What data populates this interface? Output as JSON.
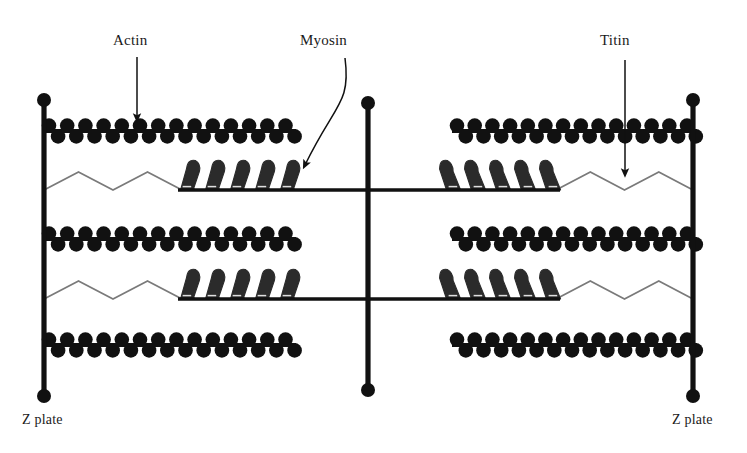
{
  "diagram": {
    "background_color": "#ffffff",
    "ink_color": "#111111",
    "titin_color": "#7a7a7a",
    "myosin_head_color": "#2b2b2b",
    "labels": {
      "actin": "Actin",
      "myosin": "Myosin",
      "titin": "Titin",
      "z_plate_left": "Z plate",
      "z_plate_right": "Z plate"
    },
    "annotations": [
      {
        "name": "actin-annotation",
        "label": "Actin",
        "label_x": 113,
        "label_y": 45,
        "arrow_type": "straight",
        "arrow_from_x": 137,
        "arrow_from_y": 57,
        "arrow_to_x": 137,
        "arrow_to_y": 118
      },
      {
        "name": "myosin-annotation",
        "label": "Myosin",
        "label_x": 300,
        "label_y": 45,
        "arrow_type": "curved",
        "arrow_from_x": 345,
        "arrow_from_y": 58,
        "arrow_to_x": 305,
        "arrow_to_y": 165
      },
      {
        "name": "titin-annotation",
        "label": "Titin",
        "label_x": 600,
        "label_y": 45,
        "arrow_type": "straight",
        "arrow_from_x": 625,
        "arrow_from_y": 60,
        "arrow_to_x": 625,
        "arrow_to_y": 173
      }
    ],
    "z_plates": [
      {
        "name": "z-plate-left",
        "x": 44,
        "y_top": 100,
        "y_bottom": 396,
        "cap_radius": 7,
        "label": "Z plate",
        "label_x": 22,
        "label_y": 424
      },
      {
        "name": "z-plate-right",
        "x": 693,
        "y_top": 100,
        "y_bottom": 396,
        "cap_radius": 7,
        "label": "Z plate",
        "label_x": 672,
        "label_y": 424
      }
    ],
    "m_line": {
      "name": "m-line",
      "x": 368,
      "y_top": 103,
      "y_bottom": 390,
      "cap_radius": 7
    },
    "actin_filaments": [
      {
        "name": "actin-filament-top-left",
        "side": "left",
        "y": 131,
        "x_start": 44,
        "x_end": 296,
        "bead_count": 14
      },
      {
        "name": "actin-filament-top-right",
        "side": "right",
        "y": 131,
        "x_start": 452,
        "x_end": 697,
        "bead_count": 14
      },
      {
        "name": "actin-filament-mid-left",
        "side": "left",
        "y": 239,
        "x_start": 44,
        "x_end": 296,
        "bead_count": 14
      },
      {
        "name": "actin-filament-mid-right",
        "side": "right",
        "y": 239,
        "x_start": 452,
        "x_end": 697,
        "bead_count": 14
      },
      {
        "name": "actin-filament-bottom-left",
        "side": "left",
        "y": 345,
        "x_start": 44,
        "x_end": 296,
        "bead_count": 14
      },
      {
        "name": "actin-filament-bottom-right",
        "side": "right",
        "y": 345,
        "x_start": 452,
        "x_end": 697,
        "bead_count": 14
      }
    ],
    "myosin_filaments": [
      {
        "name": "myosin-filament-upper",
        "y": 190,
        "x_start": 182,
        "x_end": 556,
        "head_count_per_side": 5
      },
      {
        "name": "myosin-filament-lower",
        "y": 299,
        "x_start": 182,
        "x_end": 556,
        "head_count_per_side": 5
      }
    ],
    "titin_strands": [
      {
        "name": "titin-strand-upper-left",
        "side": "left",
        "y_base": 190,
        "x_start": 44,
        "x_end": 182,
        "peaks": 2,
        "amplitude": 18
      },
      {
        "name": "titin-strand-upper-right",
        "side": "right",
        "y_base": 190,
        "x_start": 556,
        "x_end": 693,
        "peaks": 2,
        "amplitude": 18
      },
      {
        "name": "titin-strand-lower-left",
        "side": "left",
        "y_base": 299,
        "x_start": 44,
        "x_end": 182,
        "peaks": 2,
        "amplitude": 18
      },
      {
        "name": "titin-strand-lower-right",
        "side": "right",
        "y_base": 299,
        "x_start": 556,
        "x_end": 693,
        "peaks": 2,
        "amplitude": 18
      }
    ]
  }
}
